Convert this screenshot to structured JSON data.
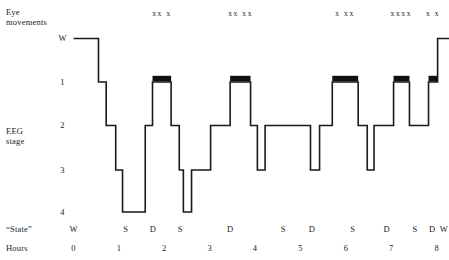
{
  "chart_data": {
    "type": "line",
    "title": "",
    "subtitle": "",
    "xlabel": "Hours",
    "ylabel": "EEG stage",
    "xlim": [
      0,
      8.3
    ],
    "ylim_stages": [
      "W",
      "1",
      "2",
      "3",
      "4"
    ],
    "grid": false,
    "legend": "none",
    "axis_note": "Sleep hypnogram: EEG stage versus hours of sleep; stage axis inverted (W at top, 4 at bottom)",
    "series": [
      {
        "name": "EEG stage",
        "description": "Step trace of sleep stage over 8 hours",
        "points": [
          {
            "hour": 0.0,
            "stage": "W"
          },
          {
            "hour": 0.55,
            "stage": "W"
          },
          {
            "hour": 0.55,
            "stage": "1"
          },
          {
            "hour": 0.72,
            "stage": "1"
          },
          {
            "hour": 0.72,
            "stage": "2"
          },
          {
            "hour": 0.93,
            "stage": "2"
          },
          {
            "hour": 0.93,
            "stage": "3"
          },
          {
            "hour": 1.08,
            "stage": "3"
          },
          {
            "hour": 1.08,
            "stage": "4"
          },
          {
            "hour": 1.58,
            "stage": "4"
          },
          {
            "hour": 1.58,
            "stage": "2"
          },
          {
            "hour": 1.74,
            "stage": "2"
          },
          {
            "hour": 1.74,
            "stage": "1"
          },
          {
            "hour": 2.15,
            "stage": "1"
          },
          {
            "hour": 2.15,
            "stage": "2"
          },
          {
            "hour": 2.33,
            "stage": "2"
          },
          {
            "hour": 2.33,
            "stage": "3"
          },
          {
            "hour": 2.42,
            "stage": "3"
          },
          {
            "hour": 2.42,
            "stage": "4"
          },
          {
            "hour": 2.6,
            "stage": "4"
          },
          {
            "hour": 2.6,
            "stage": "3"
          },
          {
            "hour": 3.02,
            "stage": "3"
          },
          {
            "hour": 3.02,
            "stage": "2"
          },
          {
            "hour": 3.45,
            "stage": "2"
          },
          {
            "hour": 3.45,
            "stage": "1"
          },
          {
            "hour": 3.9,
            "stage": "1"
          },
          {
            "hour": 3.9,
            "stage": "2"
          },
          {
            "hour": 4.05,
            "stage": "2"
          },
          {
            "hour": 4.05,
            "stage": "3"
          },
          {
            "hour": 4.22,
            "stage": "3"
          },
          {
            "hour": 4.22,
            "stage": "2"
          },
          {
            "hour": 5.22,
            "stage": "2"
          },
          {
            "hour": 5.22,
            "stage": "3"
          },
          {
            "hour": 5.42,
            "stage": "3"
          },
          {
            "hour": 5.42,
            "stage": "2"
          },
          {
            "hour": 5.7,
            "stage": "2"
          },
          {
            "hour": 5.7,
            "stage": "1"
          },
          {
            "hour": 6.27,
            "stage": "1"
          },
          {
            "hour": 6.27,
            "stage": "2"
          },
          {
            "hour": 6.47,
            "stage": "2"
          },
          {
            "hour": 6.47,
            "stage": "3"
          },
          {
            "hour": 6.62,
            "stage": "3"
          },
          {
            "hour": 6.62,
            "stage": "2"
          },
          {
            "hour": 7.05,
            "stage": "2"
          },
          {
            "hour": 7.05,
            "stage": "1"
          },
          {
            "hour": 7.4,
            "stage": "1"
          },
          {
            "hour": 7.4,
            "stage": "2"
          },
          {
            "hour": 7.82,
            "stage": "2"
          },
          {
            "hour": 7.82,
            "stage": "1"
          },
          {
            "hour": 8.02,
            "stage": "1"
          },
          {
            "hour": 8.02,
            "stage": "W"
          },
          {
            "hour": 8.3,
            "stage": "W"
          }
        ]
      }
    ],
    "rem_bars": [
      {
        "start_hour": 1.74,
        "end_hour": 2.15,
        "stage": "1",
        "label": "REM period 1"
      },
      {
        "start_hour": 3.45,
        "end_hour": 3.9,
        "stage": "1",
        "label": "REM period 2"
      },
      {
        "start_hour": 5.7,
        "end_hour": 6.27,
        "stage": "1",
        "label": "REM period 3"
      },
      {
        "start_hour": 7.05,
        "end_hour": 7.4,
        "stage": "1",
        "label": "REM period 4"
      },
      {
        "start_hour": 7.82,
        "end_hour": 8.02,
        "stage": "1",
        "label": "REM period 5"
      }
    ],
    "eye_movement_groups": [
      {
        "marks": "xx x",
        "center_hour": 1.95
      },
      {
        "marks": "xx xx",
        "center_hour": 3.68
      },
      {
        "marks": "x xx",
        "center_hour": 5.98
      },
      {
        "marks": "xxxx",
        "center_hour": 7.22
      },
      {
        "marks": "x x",
        "center_hour": 7.92
      }
    ],
    "state_markers": [
      {
        "letter": "W",
        "hour": 0.0
      },
      {
        "letter": "S",
        "hour": 1.15
      },
      {
        "letter": "D",
        "hour": 1.75
      },
      {
        "letter": "S",
        "hour": 2.35
      },
      {
        "letter": "D",
        "hour": 3.45
      },
      {
        "letter": "S",
        "hour": 4.62
      },
      {
        "letter": "D",
        "hour": 5.25
      },
      {
        "letter": "S",
        "hour": 6.15
      },
      {
        "letter": "D",
        "hour": 6.9
      },
      {
        "letter": "S",
        "hour": 7.52
      },
      {
        "letter": "D",
        "hour": 7.9
      },
      {
        "letter": "W",
        "hour": 8.16
      }
    ],
    "hour_ticks": [
      "0",
      "1",
      "2",
      "3",
      "4",
      "5",
      "6",
      "7",
      "8"
    ],
    "stage_ticks": [
      "W",
      "1",
      "2",
      "3",
      "4"
    ],
    "colors": {
      "trace": "#1a1a1a",
      "rem_bar": "#111111",
      "background": "#ffffff",
      "text": "#1a1a1a"
    }
  },
  "axes": {
    "eye_movements_label_line1": "Eye",
    "eye_movements_label_line2": "movements",
    "eeg_stage_label_line1": "EEG",
    "eeg_stage_label_line2": "stage",
    "state_row_label": "“State”",
    "hours_row_label": "Hours"
  }
}
